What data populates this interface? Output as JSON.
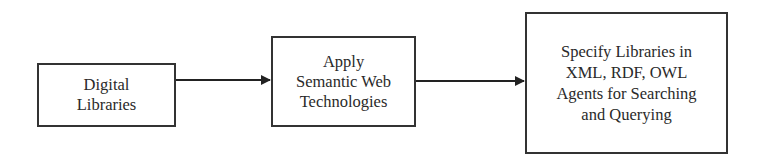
{
  "diagram": {
    "type": "flowchart",
    "direction": "left-to-right",
    "nodes": [
      {
        "id": "digital-libraries",
        "label": "Digital\nLibraries"
      },
      {
        "id": "apply-semantic-web",
        "label": "Apply\nSemantic Web\nTechnologies"
      },
      {
        "id": "specify-libraries",
        "label": "Specify Libraries in\nXML, RDF, OWL\nAgents for Searching\nand Querying"
      }
    ],
    "edges": [
      {
        "from": "digital-libraries",
        "to": "apply-semantic-web"
      },
      {
        "from": "apply-semantic-web",
        "to": "specify-libraries"
      }
    ],
    "colors": {
      "stroke": "#333333",
      "text": "#2a2a2a",
      "background": "#ffffff"
    }
  }
}
